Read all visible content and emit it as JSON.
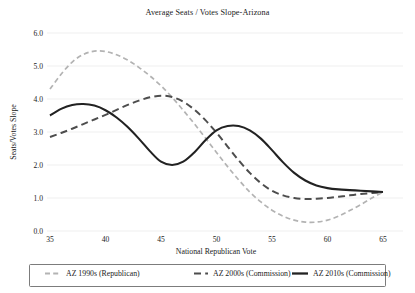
{
  "chart_data": {
    "type": "line",
    "title": "Average Seats / Votes Slope-Arizona",
    "xlabel": "National Republican Vote",
    "ylabel": "Seats/Votes Slope",
    "xlim": [
      35,
      65
    ],
    "ylim": [
      0.0,
      6.0
    ],
    "xticks": [
      35,
      40,
      45,
      50,
      55,
      60,
      65
    ],
    "xtick_labels": [
      "35",
      "40",
      "45",
      "50",
      "55",
      "60",
      "65"
    ],
    "yticks": [
      0.0,
      1.0,
      2.0,
      3.0,
      4.0,
      5.0,
      6.0
    ],
    "ytick_labels": [
      "0.0",
      "1.0",
      "2.0",
      "3.0",
      "4.0",
      "5.0",
      "6.0"
    ],
    "grid": true,
    "grid_axis": "y",
    "legend_position": "below",
    "series": [
      {
        "name": "AZ 1990s (Republican)",
        "color": "#b3b3b3",
        "style": "dashed",
        "dasharray": "5,3.2",
        "width": 1.7,
        "x": [
          35,
          36,
          37,
          38,
          39,
          40,
          41,
          42,
          43,
          44,
          45,
          46,
          47,
          48,
          49,
          50,
          51,
          52,
          53,
          54,
          55,
          56,
          57,
          58,
          59,
          60,
          61,
          62,
          63,
          64,
          65
        ],
        "y": [
          4.3,
          4.75,
          5.12,
          5.35,
          5.45,
          5.44,
          5.34,
          5.18,
          4.96,
          4.7,
          4.4,
          4.05,
          3.66,
          3.25,
          2.82,
          2.38,
          1.95,
          1.55,
          1.18,
          0.88,
          0.63,
          0.45,
          0.33,
          0.27,
          0.27,
          0.33,
          0.45,
          0.62,
          0.8,
          1.0,
          1.18
        ]
      },
      {
        "name": "AZ 2000s (Commission)",
        "color": "#4d4d4d",
        "style": "dashed",
        "dasharray": "7,4.2",
        "width": 2.0,
        "x": [
          35,
          36,
          37,
          38,
          39,
          40,
          41,
          42,
          43,
          44,
          45,
          46,
          47,
          48,
          49,
          50,
          51,
          52,
          53,
          54,
          55,
          56,
          57,
          58,
          59,
          60,
          61,
          62,
          63,
          64,
          65
        ],
        "y": [
          2.85,
          2.97,
          3.1,
          3.24,
          3.38,
          3.52,
          3.67,
          3.82,
          3.95,
          4.05,
          4.1,
          4.06,
          3.92,
          3.68,
          3.36,
          2.98,
          2.56,
          2.14,
          1.76,
          1.45,
          1.22,
          1.08,
          1.0,
          0.97,
          0.98,
          1.0,
          1.04,
          1.08,
          1.12,
          1.15,
          1.18
        ]
      },
      {
        "name": "AZ 2010s (Commission)",
        "color": "#222222",
        "style": "solid",
        "dasharray": "",
        "width": 2.1,
        "x": [
          35,
          36,
          37,
          38,
          39,
          40,
          41,
          42,
          43,
          44,
          45,
          46,
          47,
          48,
          49,
          50,
          51,
          52,
          53,
          54,
          55,
          56,
          57,
          58,
          59,
          60,
          61,
          62,
          63,
          64,
          65
        ],
        "y": [
          3.5,
          3.7,
          3.82,
          3.85,
          3.8,
          3.66,
          3.44,
          3.15,
          2.8,
          2.42,
          2.1,
          2.0,
          2.1,
          2.38,
          2.75,
          3.05,
          3.18,
          3.18,
          3.05,
          2.8,
          2.45,
          2.08,
          1.76,
          1.53,
          1.38,
          1.3,
          1.26,
          1.24,
          1.22,
          1.2,
          1.18
        ]
      }
    ]
  },
  "legend": {
    "items": [
      {
        "label": "AZ 1990s (Republican)"
      },
      {
        "label": "AZ 2000s (Commission)"
      },
      {
        "label": "AZ 2010s (Commission)"
      }
    ]
  },
  "colors": {
    "series_1990s": "#b3b3b3",
    "series_2000s": "#4d4d4d",
    "series_2010s": "#222222",
    "gridline": "#e8e8e8",
    "legend_border": "#5a5a5a",
    "text": "#1a1a1a",
    "background": "#ffffff"
  }
}
